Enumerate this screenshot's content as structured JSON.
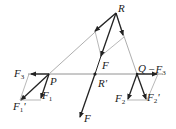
{
  "diagram": {
    "type": "force-vector-diagram",
    "labels": {
      "R": "R",
      "P": "P",
      "Q": "Q",
      "F_top": "F",
      "R_prime": "R'",
      "F_bottom": "F",
      "F3": "F",
      "F3_sub": "3",
      "F1": "F",
      "F1_sub": "1",
      "F1_prime": "F",
      "F1_prime_sub": "1",
      "F1_prime_mark": "'",
      "neg_F3": "−F",
      "neg_F3_sub": "3",
      "F2": "F",
      "F2_sub": "2",
      "F2_prime": "F",
      "F2_prime_sub": "2",
      "F2_prime_mark": "'"
    },
    "colors": {
      "thick_line": "#222222",
      "thin_line": "#888888",
      "text": "#222222"
    }
  }
}
